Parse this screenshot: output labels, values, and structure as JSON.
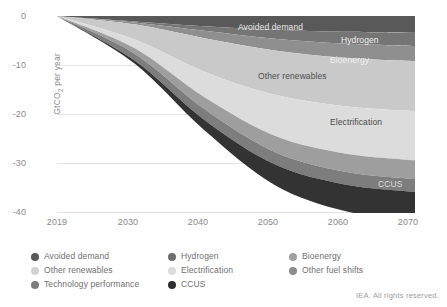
{
  "chart_data": {
    "type": "area",
    "stacked": true,
    "direction": "negative",
    "title": "",
    "xlabel": "",
    "ylabel": "GtCO2 per year",
    "ylabel_display": "GtCO₂ per year",
    "x": [
      2019,
      2030,
      2040,
      2050,
      2060,
      2070
    ],
    "xticks": [
      "2019",
      "2030",
      "2040",
      "2050",
      "2060",
      "2070"
    ],
    "xlim": [
      2019,
      2070
    ],
    "yticks": [
      "0",
      "-10",
      "-20",
      "-30",
      "-40"
    ],
    "ytick_values": [
      0,
      -10,
      -20,
      -30,
      -40
    ],
    "ylim": [
      -40,
      0
    ],
    "grid": true,
    "legend_position": "bottom",
    "note": "Cumulative stacked negative emission reductions by mitigation lever",
    "series": [
      {
        "name": "Avoided demand",
        "color": "#595959",
        "values": [
          0,
          -1.1,
          -2.1,
          -2.8,
          -3.2,
          -3.4
        ]
      },
      {
        "name": "Hydrogen",
        "color": "#757575",
        "values": [
          0,
          -0.2,
          -0.9,
          -1.8,
          -2.4,
          -2.7
        ]
      },
      {
        "name": "Bioenergy",
        "color": "#8f8f8f",
        "values": [
          0,
          -0.4,
          -1.5,
          -2.4,
          -2.9,
          -3.1
        ]
      },
      {
        "name": "Other renewables",
        "color": "#c9c9c9",
        "values": [
          0,
          -3.0,
          -6.8,
          -9.0,
          -9.8,
          -10.1
        ]
      },
      {
        "name": "Electrification",
        "color": "#dcdcdc",
        "values": [
          0,
          -1.8,
          -5.2,
          -8.3,
          -9.6,
          -10.0
        ]
      },
      {
        "name": "Other fuel shifts",
        "color": "#9e9e9e",
        "values": [
          0,
          -1.1,
          -2.4,
          -3.3,
          -3.7,
          -3.8
        ]
      },
      {
        "name": "Technology performance",
        "color": "#7d7d7d",
        "values": [
          0,
          -1.4,
          -2.2,
          -2.5,
          -2.6,
          -2.6
        ]
      },
      {
        "name": "CCUS",
        "color": "#333333",
        "values": [
          0,
          -0.6,
          -2.1,
          -4.2,
          -5.4,
          -5.9
        ]
      }
    ],
    "totals": [
      0,
      -9.6,
      -23.2,
      -34.3,
      -39.6,
      -41.6
    ]
  },
  "axes": {
    "y_label": "GtCO₂ per year",
    "y_ticks": [
      "0",
      "-10",
      "-20",
      "-30",
      "-40"
    ],
    "x_ticks": [
      "2019",
      "2030",
      "2040",
      "2050",
      "2060",
      "2070"
    ]
  },
  "band_labels": {
    "avoided_demand": "Avoided demand",
    "hydrogen": "Hydrogen",
    "bioenergy": "Bioenergy",
    "other_renewables": "Other renewables",
    "electrification": "Electrification",
    "ccus": "CCUS"
  },
  "legend": {
    "columns": [
      [
        {
          "label": "Avoided demand",
          "color": "#595959"
        },
        {
          "label": "Other renewables",
          "color": "#d2d2d2"
        },
        {
          "label": "Technology performance",
          "color": "#7d7d7d"
        }
      ],
      [
        {
          "label": "Hydrogen",
          "color": "#6e6e6e"
        },
        {
          "label": "Electrification",
          "color": "#dcdcdc"
        },
        {
          "label": "CCUS",
          "color": "#2e2e2e"
        }
      ],
      [
        {
          "label": "Bioenergy",
          "color": "#a0a0a0"
        },
        {
          "label": "Other fuel shifts",
          "color": "#8d8d8d"
        }
      ]
    ]
  },
  "credit": "IEA. All rights reserved."
}
